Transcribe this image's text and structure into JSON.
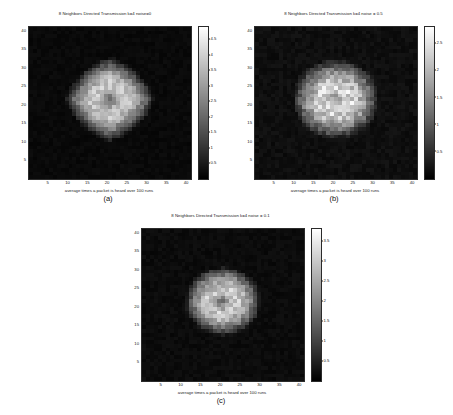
{
  "figure": {
    "background": "#ffffff",
    "colormap": "gray",
    "grid_size": 41,
    "axis_color": "#2b2b2b"
  },
  "chart_data": [
    {
      "type": "heatmap",
      "panel": "(a)",
      "title": "8 Neighbors Directed Transmission k=4 noise=0",
      "xlabel": "average times a packet is heard over 100 runs",
      "ylabel": "",
      "xticks": [
        5,
        10,
        15,
        20,
        25,
        30,
        35,
        40
      ],
      "yticks": [
        5,
        10,
        15,
        20,
        25,
        30,
        35,
        40
      ],
      "xlim": [
        0,
        41
      ],
      "ylim": [
        0,
        41
      ],
      "colorbar": {
        "ticks": [
          0.5,
          1,
          1.5,
          2,
          2.5,
          3,
          3.5,
          4,
          4.5
        ],
        "tick_labels": [
          "0.5",
          "1",
          "1.5",
          "2",
          "2.5",
          "3",
          "3.5",
          "4",
          "4.5"
        ],
        "vmin": 0,
        "vmax": 4.9
      },
      "blob": {
        "center_x": 20,
        "center_y": 21,
        "radius": 9.5,
        "shape": "diamond-round",
        "peak": 4.5,
        "background_value": 0.18,
        "core_dip": 0.55,
        "noise_amp": 0.9,
        "seed": 11
      }
    },
    {
      "type": "heatmap",
      "panel": "(b)",
      "title": "8 Neighbors Directed Transmission k=4 noise = 0.5",
      "xlabel": "average times a packet is heard over 100 runs",
      "ylabel": "",
      "xticks": [
        5,
        10,
        15,
        20,
        25,
        30,
        35,
        40
      ],
      "yticks": [
        5,
        10,
        15,
        20,
        25,
        30,
        35,
        40
      ],
      "xlim": [
        0,
        41
      ],
      "ylim": [
        0,
        41
      ],
      "colorbar": {
        "ticks": [
          0.5,
          1,
          1.5,
          2,
          2.5
        ],
        "tick_labels": [
          "0.5",
          "1",
          "1.5",
          "2",
          "2.5"
        ],
        "vmin": 0,
        "vmax": 2.8
      },
      "blob": {
        "center_x": 20,
        "center_y": 21,
        "radius": 10.5,
        "shape": "round",
        "peak": 2.6,
        "background_value": 0.16,
        "core_dip": 0.35,
        "noise_amp": 0.75,
        "seed": 27
      }
    },
    {
      "type": "heatmap",
      "panel": "(c)",
      "title": "8 Neighbors Directed Transmission k=4 noise = 0.1",
      "xlabel": "average times a packet is heard over 100 runs",
      "ylabel": "",
      "xticks": [
        5,
        10,
        15,
        20,
        25,
        30,
        35,
        40
      ],
      "yticks": [
        5,
        10,
        15,
        20,
        25,
        30,
        35,
        40
      ],
      "xlim": [
        0,
        41
      ],
      "ylim": [
        0,
        41
      ],
      "colorbar": {
        "ticks": [
          0.5,
          1,
          1.5,
          2,
          2.5,
          3,
          3.5
        ],
        "tick_labels": [
          "0.5",
          "1",
          "1.5",
          "2",
          "2.5",
          "3",
          "3.5"
        ],
        "vmin": 0,
        "vmax": 3.8
      },
      "blob": {
        "center_x": 20,
        "center_y": 21,
        "radius": 9.0,
        "shape": "round",
        "peak": 3.5,
        "background_value": 0.17,
        "core_dip": 0.5,
        "noise_amp": 0.85,
        "seed": 43
      }
    }
  ]
}
